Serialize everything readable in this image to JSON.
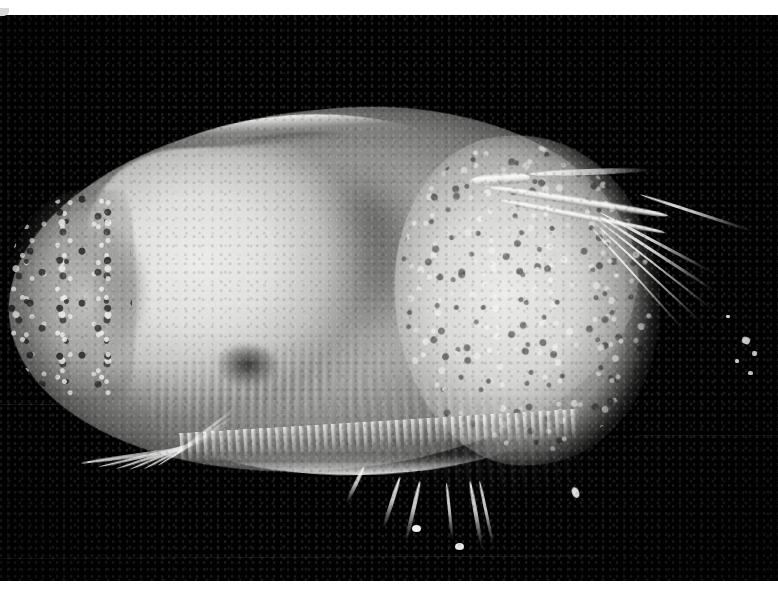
{
  "image": {
    "kind": "photomicrograph",
    "subject": "crustacean-specimen-lateral-view",
    "color_mode": "grayscale",
    "orientation": "landscape",
    "width_px": 778,
    "height_px": 593,
    "background_color": "#010101",
    "border_color": "#ffffff",
    "top_border_height_px": 15,
    "bottom_border_height_px": 12,
    "has_visible_text": false,
    "has_scale_bar": false
  },
  "subject": {
    "common_description": "bivalved planktonic crustacean (ostracod / cladoceran type) seen from the side",
    "body_axis": "horizontal, anterior at left, posterior at right",
    "dominant_tones": {
      "background": "#010101",
      "carapace_highlight": "#eeeeec",
      "carapace_midtone": "#b4b4b2",
      "internal_mass": "#e4e4e2",
      "gut_shadow": "#5c5c5a",
      "deep_shadow": "#0e0e0e"
    }
  },
  "features": [
    {
      "id": "carapace",
      "label": "carapace (bivalved shell)",
      "region": "centre",
      "tone": "mid grey, smoothly shaded"
    },
    {
      "id": "dorsal-margin",
      "label": "dorsal carapace margin",
      "region": "upper edge",
      "tone": "bright white rim over dark groove"
    },
    {
      "id": "ventral-margin",
      "label": "ventral carapace margin",
      "region": "lower edge",
      "tone": "bright white rim"
    },
    {
      "id": "anterior-margin",
      "label": "anterior margin",
      "region": "left end",
      "tone": "speckled light and dark granules"
    },
    {
      "id": "posterior-lobe",
      "label": "posterior carapace lobe",
      "region": "right",
      "tone": "bright, heavily granular / pitted"
    },
    {
      "id": "inner-mass",
      "label": "internal body mass",
      "region": "left of centre",
      "tone": "pale, soft-edged, brightest area"
    },
    {
      "id": "gut-shadow",
      "label": "gut / organ shadow",
      "region": "centre",
      "tone": "diffuse darker grey cloud"
    },
    {
      "id": "antenna",
      "label": "antenna (swimming antenna)",
      "region": "upper right",
      "tone": "thick white curved shaft"
    },
    {
      "id": "antennal-setae",
      "label": "antennal setae fan",
      "region": "far right",
      "tone": "fine bright filaments tapering to lower right"
    },
    {
      "id": "thoracic-setae",
      "label": "thoracic limb setae fan",
      "region": "lower left",
      "tone": "radiating fine white filaments"
    },
    {
      "id": "ventral-fringe",
      "label": "ventral setal fringe",
      "region": "lower centre",
      "tone": "comb-like row of fine bristles"
    },
    {
      "id": "ventral-spines",
      "label": "ventral spines / terminal claws",
      "region": "bottom centre",
      "tone": "several thin white spines with bulbed tips"
    },
    {
      "id": "striations",
      "label": "limb striations",
      "region": "lower centre-left",
      "tone": "fine parallel light-dark lines"
    },
    {
      "id": "organ-notch",
      "label": "dark organ notch",
      "region": "lower centre-left",
      "tone": "small dark rounded patch"
    },
    {
      "id": "flecks",
      "label": "detached bright fragments",
      "region": "right edge",
      "tone": "small isolated white specks on black"
    }
  ],
  "artifacts": [
    {
      "id": "scan-line-lower",
      "label": "faint horizontal scan line",
      "position": "lower left to centre"
    },
    {
      "id": "scan-line-bottom",
      "label": "faint horizontal scan line",
      "position": "near bottom edge"
    },
    {
      "id": "scan-line-right",
      "label": "faint horizontal scan line",
      "position": "right of centre"
    },
    {
      "id": "corner-nick",
      "label": "small light nick",
      "position": "top-left corner of print"
    },
    {
      "id": "film-grain",
      "label": "photographic film grain",
      "position": "whole frame"
    }
  ]
}
